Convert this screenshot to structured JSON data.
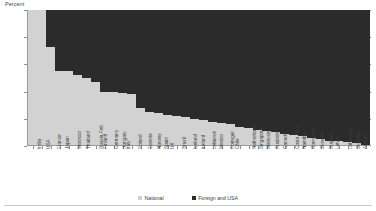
{
  "chart_data": {
    "type": "bar",
    "subtype": "stacked-100-percent",
    "title": "",
    "xlabel": "",
    "ylabel": "Percent",
    "ylim": [
      0,
      100
    ],
    "yticks": [
      0,
      20,
      40,
      60,
      80,
      100
    ],
    "grid": true,
    "legend_position": "bottom",
    "categories": [
      "India",
      "USA",
      "France",
      "Japan",
      "Morocco",
      "Thailand",
      "Russia Fed.",
      "Finland",
      "Germany",
      "Hungary",
      "Italy",
      "Poland",
      "Estonia",
      "Norway",
      "Spain",
      "UK",
      "Brazil",
      "Iceland",
      "Ireland",
      "Lebanon",
      "Mexico",
      "Portugal",
      "Chile",
      "Netherlands",
      "Singapore",
      "Malaysia",
      "Australia",
      "Canada",
      "Costa Rica",
      "Namibia",
      "Romania",
      "Slovenia",
      "Bulgaria",
      "Latvia",
      "Lithuania",
      "Slovakia",
      "Austria",
      "Switzerland"
    ],
    "series": [
      {
        "name": "National",
        "color": "#d2d2d2",
        "values": [
          100,
          100,
          73,
          55,
          55,
          52,
          50,
          47,
          40,
          40,
          39,
          38,
          28,
          25,
          24,
          23,
          22,
          21,
          20,
          19,
          18,
          17,
          16,
          14,
          13,
          12,
          11,
          10,
          9,
          8,
          7,
          6,
          5,
          4,
          4,
          3,
          2,
          1
        ]
      },
      {
        "name": "Foreign and USA",
        "color": "#2b2b2b",
        "values": [
          0,
          0,
          27,
          45,
          45,
          48,
          50,
          53,
          60,
          60,
          61,
          62,
          72,
          75,
          76,
          77,
          78,
          79,
          80,
          81,
          82,
          83,
          84,
          86,
          87,
          88,
          89,
          90,
          91,
          92,
          93,
          94,
          95,
          96,
          96,
          97,
          98,
          99
        ]
      }
    ]
  },
  "legend": {
    "items": [
      {
        "label": "National",
        "color": "#d2d2d2"
      },
      {
        "label": "Foreign and USA",
        "color": "#2b2b2b"
      }
    ]
  }
}
